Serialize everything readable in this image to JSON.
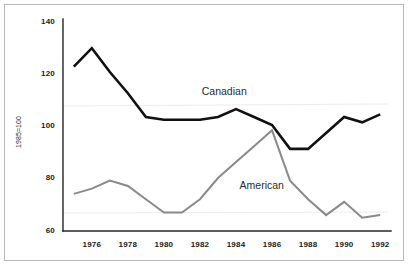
{
  "chart_data": {
    "type": "line",
    "title": "",
    "subtitle": "",
    "xlabel": "",
    "ylabel": "1985=100",
    "xlim": [
      1974.4,
      1992.6
    ],
    "ylim": [
      60,
      140
    ],
    "grid": false,
    "legend_position": "inline-annotations",
    "x_tick_labels": [
      "1976",
      "1978",
      "1980",
      "1982",
      "1984",
      "1986",
      "1988",
      "1990",
      "1992"
    ],
    "x_ticks": [
      1976,
      1978,
      1980,
      1982,
      1984,
      1986,
      1988,
      1990,
      1992
    ],
    "y_tick_labels": [
      "60",
      "80",
      "100",
      "120",
      "140"
    ],
    "y_ticks": [
      60,
      80,
      100,
      120,
      140
    ],
    "x": [
      1975,
      1976,
      1977,
      1978,
      1979,
      1980,
      1981,
      1982,
      1983,
      1984,
      1985,
      1986,
      1987,
      1988,
      1989,
      1990,
      1991,
      1992
    ],
    "series": [
      {
        "name": "Canadian",
        "color": "#111111",
        "values": [
          122,
          129,
          120,
          112,
          103,
          102,
          102,
          102,
          103,
          106,
          103,
          100,
          91,
          91,
          97,
          103,
          101,
          104
        ],
        "label_text": "Canadian",
        "label_x": 1982.1,
        "label_y": 111.5
      },
      {
        "name": "American",
        "color": "#8a8a8a",
        "values": [
          74,
          76,
          79,
          77,
          72,
          67,
          67,
          72,
          80,
          86,
          92,
          98,
          79,
          72,
          66,
          71,
          65,
          66
        ],
        "label_text": "American",
        "label_x": 1984.2,
        "label_y": 76.0
      }
    ],
    "annotations": [
      {
        "text": "Canadian",
        "series": "Canadian"
      },
      {
        "text": "American",
        "series": "American"
      }
    ]
  },
  "colors": {
    "background": "#ffffff",
    "frame_border": "#b9b9b9",
    "axis": "#262626",
    "canadian_line": "#111111",
    "american_line": "#8a8a8a",
    "tick_text": "#1a1a1a",
    "annotation_text": "#2b2b2b"
  }
}
